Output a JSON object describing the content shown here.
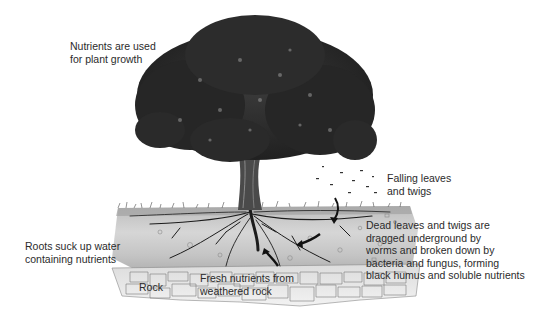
{
  "diagram": {
    "type": "illustrated nutrient cycle",
    "labels": {
      "nutrients_used": "Nutrients are used\nfor plant growth",
      "falling_leaves": "Falling leaves\nand twigs",
      "dead_leaves": "Dead leaves and twigs are\ndragged underground by\nworms and broken down by\nbacteria and fungus, forming\nblack humus and soluble nutrients",
      "roots_suck": "Roots suck up water\ncontaining nutrients",
      "fresh_nutrients": "Fresh nutrients from\nweathered rock",
      "rock": "Rock"
    },
    "arrows": [
      {
        "name": "falling-leaves-arrow",
        "direction": "down into soil"
      },
      {
        "name": "humus-arrow",
        "direction": "toward roots (left-down)"
      },
      {
        "name": "weathered-rock-arrow",
        "direction": "up toward roots"
      }
    ],
    "colors": {
      "background": "#ffffff",
      "foliage": "#2e2e2e",
      "soil": "#cfcfcf",
      "rock": "#e6e6e6",
      "text": "#2b2b2b"
    }
  }
}
